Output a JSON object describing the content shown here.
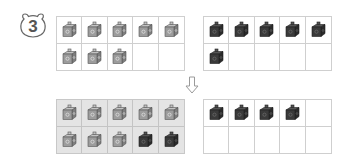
{
  "problem": {
    "number": "3",
    "badge_icon": "bear-head-icon"
  },
  "colors": {
    "light_cube": "#9a9a9a",
    "dark_cube": "#3f3f3f",
    "grid_line": "#cfcfcf",
    "shaded_bg": "#e4e4e4"
  },
  "grids": {
    "top_left": {
      "cells": [
        "light",
        "light",
        "light",
        "light",
        "light",
        "light",
        "light",
        "light",
        "empty",
        "empty"
      ],
      "count": 8
    },
    "top_right": {
      "cells": [
        "dark",
        "dark",
        "dark",
        "dark",
        "dark",
        "dark",
        "empty",
        "empty",
        "empty",
        "empty"
      ],
      "count": 6
    },
    "bottom_left": {
      "cells": [
        "light",
        "light",
        "light",
        "light",
        "light",
        "light",
        "light",
        "light",
        "dark",
        "dark"
      ],
      "count": 10
    },
    "bottom_right": {
      "cells": [
        "dark",
        "dark",
        "dark",
        "dark",
        "empty",
        "empty",
        "empty",
        "empty",
        "empty",
        "empty"
      ],
      "count": 4
    }
  },
  "arrow": {
    "icon": "down-arrow-icon"
  }
}
